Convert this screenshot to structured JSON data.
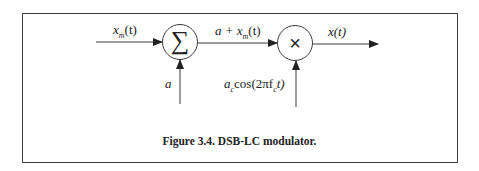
{
  "figure": {
    "caption": "Figure 3.4. DSB-LC modulator.",
    "border_color": "#3a3a3a",
    "line_color": "#3a3a3a"
  },
  "blocks": {
    "summer": {
      "symbol": "∑",
      "label": "summer"
    },
    "multiplier": {
      "symbol": "×",
      "label": "multiplier"
    }
  },
  "signals": {
    "input": {
      "base": "x",
      "sub": "m",
      "arg": "(t)"
    },
    "offset": {
      "text": "a"
    },
    "sum_output": {
      "prefix": "a + x",
      "sub": "m",
      "arg": "(t)"
    },
    "carrier": {
      "base": "a",
      "sub": "c",
      "func": "cos(2πf",
      "sub2": "c",
      "tail": "t)"
    },
    "output": {
      "text": "x(t)"
    }
  }
}
